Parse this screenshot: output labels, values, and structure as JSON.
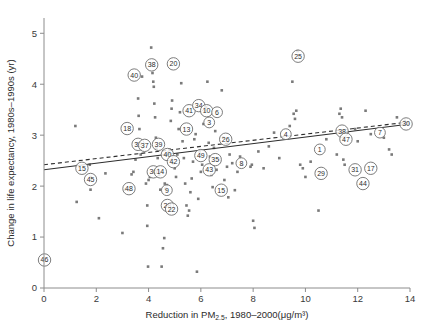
{
  "chart_data": {
    "type": "scatter",
    "title": "",
    "xlabel": "Reduction in PM2.5, 1980–2000(μg/m³)",
    "xlabel_parts": {
      "prefix": "Reduction in PM",
      "subscript": "2.5",
      "suffix": ", 1980–2000(μg/m³)"
    },
    "ylabel": "Change in life expectancy, 1980s–1990s (yr)",
    "xlim": [
      0,
      14
    ],
    "ylim": [
      0,
      5.3
    ],
    "xticks": [
      0,
      2,
      4,
      6,
      8,
      10,
      12,
      14
    ],
    "yticks": [
      0,
      1,
      2,
      3,
      4,
      5
    ],
    "xtick_labels": [
      "0",
      "2",
      "4",
      "6",
      "8",
      "10",
      "12",
      "14"
    ],
    "ytick_labels": [
      "0",
      "1",
      "2",
      "3",
      "4",
      "5"
    ],
    "grid": false,
    "legend": "none",
    "point_color": "#7a7a7a",
    "line_color": "#2d2d2d",
    "fit_lines": [
      {
        "name": "solid-regression",
        "style": "solid",
        "x0": 0,
        "y0": 2.32,
        "x1": 14,
        "y1": 3.22
      },
      {
        "name": "dashed-regression",
        "style": "dashed",
        "x0": 0,
        "y0": 2.42,
        "x1": 14,
        "y1": 3.26
      }
    ],
    "points": [
      {
        "x": 1.2,
        "y": 3.18
      },
      {
        "x": 1.25,
        "y": 1.69
      },
      {
        "x": 1.75,
        "y": 2.42
      },
      {
        "x": 1.78,
        "y": 1.93
      },
      {
        "x": 1.78,
        "y": 2.18
      },
      {
        "x": 2.1,
        "y": 1.37
      },
      {
        "x": 2.35,
        "y": 2.25
      },
      {
        "x": 3.0,
        "y": 1.08
      },
      {
        "x": 3.1,
        "y": 1.93
      },
      {
        "x": 3.25,
        "y": 1.92
      },
      {
        "x": 3.35,
        "y": 2.23
      },
      {
        "x": 3.42,
        "y": 2.28
      },
      {
        "x": 3.5,
        "y": 2.52
      },
      {
        "x": 3.55,
        "y": 2.84
      },
      {
        "x": 3.6,
        "y": 3.72
      },
      {
        "x": 3.62,
        "y": 3.38
      },
      {
        "x": 3.65,
        "y": 3.12
      },
      {
        "x": 3.7,
        "y": 2.62
      },
      {
        "x": 3.75,
        "y": 4.15
      },
      {
        "x": 3.9,
        "y": 2.05
      },
      {
        "x": 3.95,
        "y": 1.22
      },
      {
        "x": 3.95,
        "y": 1.62
      },
      {
        "x": 3.98,
        "y": 0.42
      },
      {
        "x": 4.0,
        "y": 2.12
      },
      {
        "x": 4.05,
        "y": 2.18
      },
      {
        "x": 4.1,
        "y": 4.72
      },
      {
        "x": 4.12,
        "y": 4.38
      },
      {
        "x": 4.15,
        "y": 4.22
      },
      {
        "x": 4.18,
        "y": 4.05
      },
      {
        "x": 4.2,
        "y": 3.95
      },
      {
        "x": 4.22,
        "y": 3.62
      },
      {
        "x": 4.25,
        "y": 3.35
      },
      {
        "x": 4.28,
        "y": 2.95
      },
      {
        "x": 4.3,
        "y": 2.74
      },
      {
        "x": 4.35,
        "y": 2.55
      },
      {
        "x": 4.4,
        "y": 2.22
      },
      {
        "x": 4.45,
        "y": 1.93
      },
      {
        "x": 4.5,
        "y": 0.42
      },
      {
        "x": 4.55,
        "y": 0.78
      },
      {
        "x": 4.6,
        "y": 0.98
      },
      {
        "x": 4.62,
        "y": 2.05
      },
      {
        "x": 4.65,
        "y": 1.95
      },
      {
        "x": 4.7,
        "y": 2.02
      },
      {
        "x": 4.75,
        "y": 2.66
      },
      {
        "x": 4.8,
        "y": 2.72
      },
      {
        "x": 4.85,
        "y": 3.28
      },
      {
        "x": 4.88,
        "y": 3.52
      },
      {
        "x": 4.9,
        "y": 3.68
      },
      {
        "x": 4.95,
        "y": 2.45
      },
      {
        "x": 5.0,
        "y": 2.35
      },
      {
        "x": 5.05,
        "y": 2.18
      },
      {
        "x": 5.1,
        "y": 2.62
      },
      {
        "x": 5.15,
        "y": 3.12
      },
      {
        "x": 5.2,
        "y": 3.45
      },
      {
        "x": 5.25,
        "y": 4.02
      },
      {
        "x": 5.3,
        "y": 2.88
      },
      {
        "x": 5.35,
        "y": 2.55
      },
      {
        "x": 5.4,
        "y": 2.05
      },
      {
        "x": 5.45,
        "y": 1.62
      },
      {
        "x": 5.5,
        "y": 1.42
      },
      {
        "x": 5.55,
        "y": 1.52
      },
      {
        "x": 5.6,
        "y": 1.88
      },
      {
        "x": 5.65,
        "y": 2.15
      },
      {
        "x": 5.7,
        "y": 2.48
      },
      {
        "x": 5.75,
        "y": 2.92
      },
      {
        "x": 5.8,
        "y": 3.02
      },
      {
        "x": 5.85,
        "y": 0.32
      },
      {
        "x": 5.9,
        "y": 1.75
      },
      {
        "x": 5.95,
        "y": 2.68
      },
      {
        "x": 6.0,
        "y": 2.28
      },
      {
        "x": 6.05,
        "y": 2.42
      },
      {
        "x": 6.1,
        "y": 3.22
      },
      {
        "x": 6.15,
        "y": 3.48
      },
      {
        "x": 6.2,
        "y": 3.55
      },
      {
        "x": 6.25,
        "y": 4.05
      },
      {
        "x": 6.3,
        "y": 2.85
      },
      {
        "x": 6.35,
        "y": 2.58
      },
      {
        "x": 6.4,
        "y": 2.22
      },
      {
        "x": 6.45,
        "y": 1.98
      },
      {
        "x": 6.5,
        "y": 2.75
      },
      {
        "x": 6.55,
        "y": 3.08
      },
      {
        "x": 6.6,
        "y": 2.32
      },
      {
        "x": 6.7,
        "y": 2.52
      },
      {
        "x": 6.8,
        "y": 3.88
      },
      {
        "x": 6.85,
        "y": 2.95
      },
      {
        "x": 6.9,
        "y": 2.12
      },
      {
        "x": 7.0,
        "y": 2.38
      },
      {
        "x": 7.05,
        "y": 1.78
      },
      {
        "x": 7.1,
        "y": 2.62
      },
      {
        "x": 7.2,
        "y": 2.45
      },
      {
        "x": 7.3,
        "y": 1.92
      },
      {
        "x": 7.4,
        "y": 2.28
      },
      {
        "x": 7.5,
        "y": 2.58
      },
      {
        "x": 7.6,
        "y": 2.42
      },
      {
        "x": 7.9,
        "y": 2.38
      },
      {
        "x": 7.95,
        "y": 2.42
      },
      {
        "x": 8.0,
        "y": 1.32
      },
      {
        "x": 8.05,
        "y": 1.18
      },
      {
        "x": 8.2,
        "y": 2.68
      },
      {
        "x": 8.4,
        "y": 2.35
      },
      {
        "x": 8.6,
        "y": 2.78
      },
      {
        "x": 8.8,
        "y": 3.05
      },
      {
        "x": 9.0,
        "y": 2.55
      },
      {
        "x": 9.4,
        "y": 3.18
      },
      {
        "x": 9.5,
        "y": 4.05
      },
      {
        "x": 9.55,
        "y": 3.42
      },
      {
        "x": 9.6,
        "y": 3.32
      },
      {
        "x": 9.65,
        "y": 3.48
      },
      {
        "x": 9.7,
        "y": 4.65
      },
      {
        "x": 9.8,
        "y": 2.42
      },
      {
        "x": 9.9,
        "y": 2.35
      },
      {
        "x": 10.0,
        "y": 2.18
      },
      {
        "x": 10.2,
        "y": 2.48
      },
      {
        "x": 10.5,
        "y": 1.52
      },
      {
        "x": 10.8,
        "y": 2.92
      },
      {
        "x": 11.2,
        "y": 2.62
      },
      {
        "x": 11.3,
        "y": 3.42
      },
      {
        "x": 11.35,
        "y": 3.52
      },
      {
        "x": 11.4,
        "y": 3.35
      },
      {
        "x": 11.45,
        "y": 2.52
      },
      {
        "x": 11.5,
        "y": 2.42
      },
      {
        "x": 11.6,
        "y": 3.05
      },
      {
        "x": 11.9,
        "y": 3.12
      },
      {
        "x": 12.0,
        "y": 2.88
      },
      {
        "x": 12.3,
        "y": 3.48
      },
      {
        "x": 12.5,
        "y": 3.02
      },
      {
        "x": 13.0,
        "y": 2.95
      },
      {
        "x": 13.2,
        "y": 2.72
      },
      {
        "x": 13.3,
        "y": 2.62
      },
      {
        "x": 13.5,
        "y": 3.35
      },
      {
        "x": 13.8,
        "y": 3.28
      }
    ],
    "labeled_points": [
      {
        "label": "46",
        "x": 0.02,
        "y": 0.55
      },
      {
        "label": "15",
        "x": 1.45,
        "y": 2.35
      },
      {
        "label": "45",
        "x": 1.78,
        "y": 2.13
      },
      {
        "label": "18",
        "x": 3.18,
        "y": 3.13
      },
      {
        "label": "48",
        "x": 3.25,
        "y": 1.95
      },
      {
        "label": "40",
        "x": 3.45,
        "y": 4.18
      },
      {
        "label": "32",
        "x": 3.6,
        "y": 2.82
      },
      {
        "label": "37",
        "x": 3.85,
        "y": 2.8
      },
      {
        "label": "38",
        "x": 4.12,
        "y": 4.38
      },
      {
        "label": "39",
        "x": 4.38,
        "y": 2.82
      },
      {
        "label": "36",
        "x": 4.18,
        "y": 2.28
      },
      {
        "label": "14",
        "x": 4.45,
        "y": 2.28
      },
      {
        "label": "40",
        "x": 4.72,
        "y": 2.62
      },
      {
        "label": "42",
        "x": 4.95,
        "y": 2.48
      },
      {
        "label": "9",
        "x": 4.7,
        "y": 1.92
      },
      {
        "label": "28",
        "x": 4.72,
        "y": 1.62
      },
      {
        "label": "22",
        "x": 4.88,
        "y": 1.55
      },
      {
        "label": "20",
        "x": 4.95,
        "y": 4.4
      },
      {
        "label": "13",
        "x": 5.45,
        "y": 3.12
      },
      {
        "label": "41",
        "x": 5.55,
        "y": 3.48
      },
      {
        "label": "34",
        "x": 5.92,
        "y": 3.58
      },
      {
        "label": "10",
        "x": 6.22,
        "y": 3.48
      },
      {
        "label": "6",
        "x": 6.62,
        "y": 3.45
      },
      {
        "label": "3",
        "x": 6.32,
        "y": 3.25
      },
      {
        "label": "43",
        "x": 6.32,
        "y": 2.32
      },
      {
        "label": "35",
        "x": 6.55,
        "y": 2.52
      },
      {
        "label": "49",
        "x": 6.0,
        "y": 2.6
      },
      {
        "label": "26",
        "x": 6.95,
        "y": 2.92
      },
      {
        "label": "15",
        "x": 6.78,
        "y": 1.92
      },
      {
        "label": "8",
        "x": 7.55,
        "y": 2.45
      },
      {
        "label": "25",
        "x": 9.72,
        "y": 4.55
      },
      {
        "label": "4",
        "x": 9.25,
        "y": 3.02
      },
      {
        "label": "1",
        "x": 10.55,
        "y": 2.72
      },
      {
        "label": "29",
        "x": 10.6,
        "y": 2.25
      },
      {
        "label": "38",
        "x": 11.4,
        "y": 3.08
      },
      {
        "label": "47",
        "x": 11.55,
        "y": 2.92
      },
      {
        "label": "31",
        "x": 11.9,
        "y": 2.32
      },
      {
        "label": "17",
        "x": 12.5,
        "y": 2.35
      },
      {
        "label": "44",
        "x": 12.2,
        "y": 2.05
      },
      {
        "label": "7",
        "x": 12.85,
        "y": 3.05
      },
      {
        "label": "30",
        "x": 13.85,
        "y": 3.22
      }
    ]
  }
}
